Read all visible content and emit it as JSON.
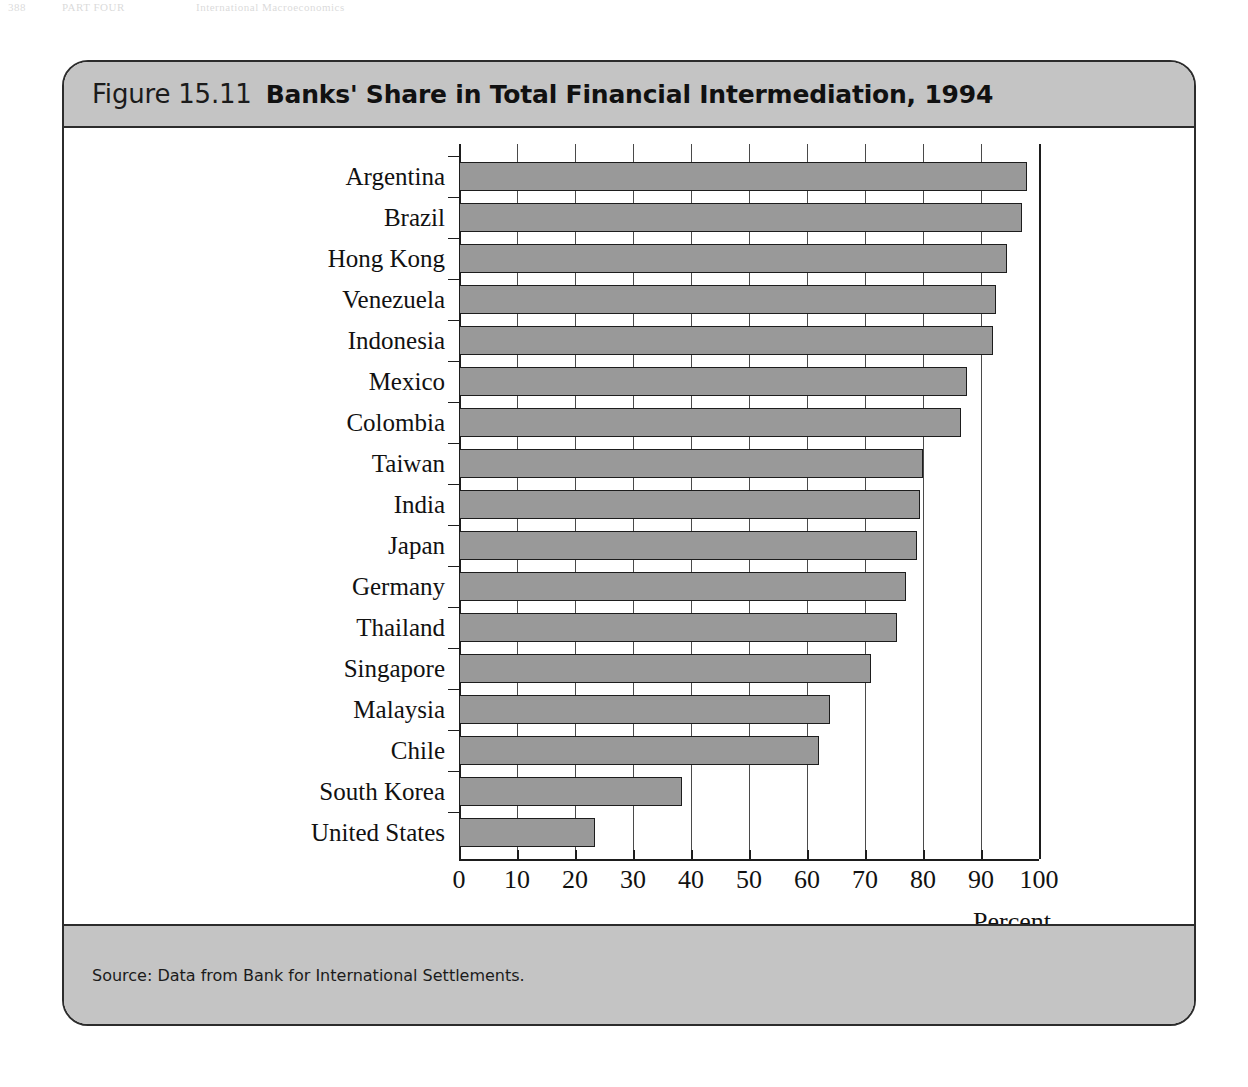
{
  "page_header": {
    "page_number": "388",
    "chapter": "PART FOUR",
    "running_title": "International Macroeconomics"
  },
  "figure": {
    "number_label": "Figure 15.11",
    "title": "Banks' Share in Total Financial Intermediation, 1994",
    "source_note": "Source: Data from Bank for International Settlements.",
    "page_marker": "4",
    "colors": {
      "title_bar_background": "#c4c4c4",
      "footer_bar_background": "#c4c4c4",
      "bar_fill": "#999999",
      "bar_outline": "#1d1d1d",
      "plot_background": "#ffffff",
      "frame_border": "#2c2c2c"
    }
  },
  "chart_data": {
    "type": "bar",
    "orientation": "horizontal",
    "title": "Banks' Share in Total Financial Intermediation, 1994",
    "xlabel": "Percent",
    "ylabel": "",
    "xlim": [
      0,
      100
    ],
    "grid": true,
    "legend": "none",
    "xticks": [
      0,
      10,
      20,
      30,
      40,
      50,
      60,
      70,
      80,
      90,
      100
    ],
    "xtick_labels": [
      "0",
      "10",
      "20",
      "30",
      "40",
      "50",
      "60",
      "70",
      "80",
      "90",
      "100"
    ],
    "categories": [
      "Argentina",
      "Brazil",
      "Hong Kong",
      "Venezuela",
      "Indonesia",
      "Mexico",
      "Colombia",
      "Taiwan",
      "India",
      "Japan",
      "Germany",
      "Thailand",
      "Singapore",
      "Malaysia",
      "Chile",
      "South Korea",
      "United States"
    ],
    "values": [
      98,
      97,
      94.5,
      92.5,
      92,
      87.5,
      86.5,
      80,
      79.5,
      79,
      77,
      75.5,
      71,
      64,
      62,
      38.5,
      23.5
    ]
  }
}
